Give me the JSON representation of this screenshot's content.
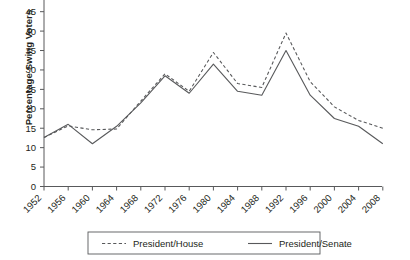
{
  "chart_data": {
    "type": "line",
    "title": "",
    "xlabel": "",
    "ylabel": "Percentage Swing Voters",
    "ylim": [
      0,
      45
    ],
    "yticks": [
      0,
      5,
      10,
      15,
      20,
      25,
      30,
      35,
      40,
      45
    ],
    "grid": false,
    "legend_position": "bottom",
    "categories": [
      "1952",
      "1956",
      "1960",
      "1964",
      "1968",
      "1972",
      "1976",
      "1980",
      "1984",
      "1988",
      "1992",
      "1996",
      "2000",
      "2004",
      "2008"
    ],
    "series": [
      {
        "name": "President/House",
        "style": "dashed",
        "color": "#58595b",
        "values": [
          12.6,
          15.6,
          14.6,
          14.8,
          22.0,
          29.0,
          24.5,
          34.5,
          26.5,
          25.5,
          39.5,
          27.0,
          20.5,
          17.0,
          15.0
        ]
      },
      {
        "name": "President/Senate",
        "style": "solid",
        "color": "#58595b",
        "values": [
          12.6,
          16.0,
          11.0,
          15.5,
          21.5,
          28.5,
          24.0,
          31.5,
          24.5,
          23.5,
          35.0,
          23.5,
          17.5,
          15.5,
          11.0
        ]
      }
    ]
  },
  "axis": {
    "y_label": "Percentage Swing Voters"
  },
  "legend": {
    "items": [
      {
        "label": "President/House",
        "style": "dashed"
      },
      {
        "label": "President/Senate",
        "style": "solid"
      }
    ]
  }
}
